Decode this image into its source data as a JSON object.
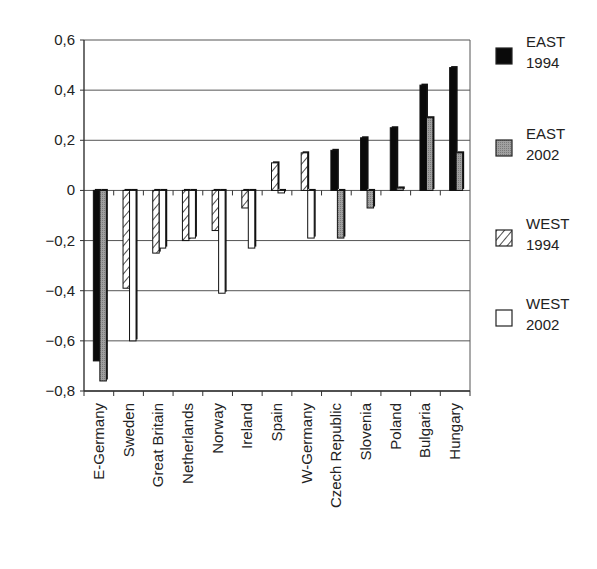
{
  "chart_data": {
    "type": "bar",
    "title": "",
    "xlabel": "",
    "ylabel": "",
    "ylim": [
      -0.8,
      0.6
    ],
    "yticks": [
      0.6,
      0.4,
      0.2,
      0,
      -0.2,
      -0.4,
      -0.6,
      -0.8
    ],
    "ytick_labels": [
      "0,6",
      "0,4",
      "0,2",
      "0",
      "−0,2",
      "−0,4",
      "−0,6",
      "−0,8"
    ],
    "grid": true,
    "legend_position": "right",
    "categories": [
      "E-Germany",
      "Sweden",
      "Great Britain",
      "Netherlands",
      "Norway",
      "Ireland",
      "Spain",
      "W-Germany",
      "Czech Republic",
      "Slovenia",
      "Poland",
      "Bulgaria",
      "Hungary"
    ],
    "series": [
      {
        "name": "EAST 1994",
        "label_line1": "EAST",
        "label_line2": "1994",
        "style": "solid-black",
        "values": [
          -0.68,
          null,
          null,
          null,
          null,
          null,
          null,
          null,
          0.16,
          0.21,
          0.25,
          0.42,
          0.49
        ]
      },
      {
        "name": "EAST 2002",
        "label_line1": "EAST",
        "label_line2": "2002",
        "style": "gray",
        "values": [
          -0.76,
          null,
          null,
          null,
          null,
          null,
          null,
          null,
          -0.19,
          -0.07,
          0.01,
          0.29,
          0.15
        ]
      },
      {
        "name": "WEST 1994",
        "label_line1": "WEST",
        "label_line2": "1994",
        "style": "hatched",
        "values": [
          null,
          -0.39,
          -0.25,
          -0.2,
          -0.16,
          -0.07,
          0.11,
          0.15,
          null,
          null,
          null,
          null,
          null
        ]
      },
      {
        "name": "WEST 2002",
        "label_line1": "WEST",
        "label_line2": "2002",
        "style": "white",
        "values": [
          null,
          -0.6,
          -0.23,
          -0.19,
          -0.41,
          -0.23,
          -0.01,
          -0.19,
          null,
          null,
          null,
          null,
          null
        ]
      }
    ],
    "colors": {
      "east_1994": "#0a0a0a",
      "east_2002": "#9a9a9a",
      "west_1994": "#ffffff",
      "west_2002": "#ffffff",
      "grid": "#555555",
      "axis": "#333333"
    }
  }
}
